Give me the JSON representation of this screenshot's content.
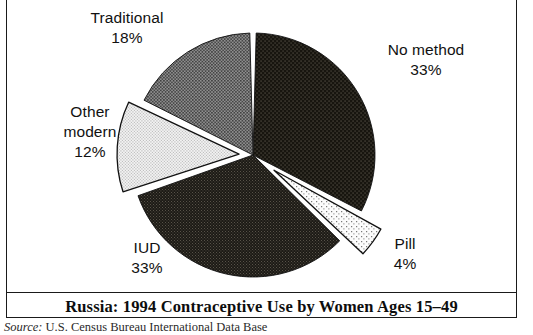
{
  "figure": {
    "title": "Russia: 1994 Contraceptive Use by Women Ages 15–49",
    "source_label": "Source:",
    "source_text": " U.S. Census Bureau International Data Base",
    "frame_color": "#1a1a1a",
    "background": "#ffffff"
  },
  "labels": {
    "no_method": {
      "name": "No method",
      "pct": "33%"
    },
    "traditional": {
      "name": "Traditional",
      "pct": "18%"
    },
    "other_modern": {
      "name_line1": "Other",
      "name_line2": "modern",
      "pct": "12%"
    },
    "iud": {
      "name": "IUD",
      "pct": "33%"
    },
    "pill": {
      "name": "Pill",
      "pct": "4%"
    }
  },
  "chart_data": {
    "type": "pie",
    "title": "Russia: 1994 Contraceptive Use by Women Ages 15–49",
    "xlabel": "",
    "ylabel": "",
    "units": "percent of women ages 15–49",
    "start_angle_deg": 0,
    "direction": "clockwise",
    "center_px": [
      253,
      155
    ],
    "radius_px": 122,
    "legend": "none (direct slice labels)",
    "grid": false,
    "categories": [
      "No method",
      "Pill",
      "IUD",
      "Other modern",
      "Traditional"
    ],
    "values": [
      33,
      4,
      33,
      12,
      18
    ],
    "slices": [
      {
        "label": "No method",
        "value": 33,
        "value_text": "33%",
        "start_deg": 0,
        "end_deg": 118.8,
        "fill": "#17150f",
        "pattern": "fine-light-dots-on-black",
        "exploded": false,
        "explode_px": 0
      },
      {
        "label": "Pill",
        "value": 4,
        "value_text": "4%",
        "start_deg": 118.8,
        "end_deg": 133.2,
        "fill": "#fbfbfb",
        "pattern": "sparse-dark-dots-on-white",
        "exploded": true,
        "explode_px": 26
      },
      {
        "label": "IUD",
        "value": 33,
        "value_text": "33%",
        "start_deg": 133.2,
        "end_deg": 252.0,
        "fill": "#1d1b16",
        "pattern": "dense-fine-dots-dark",
        "exploded": false,
        "explode_px": 0
      },
      {
        "label": "Other modern",
        "value": 12,
        "value_text": "12%",
        "start_deg": 252.0,
        "end_deg": 295.2,
        "fill": "#e8e8e8",
        "pattern": "fine-dots-light-gray",
        "exploded": true,
        "explode_px": 14
      },
      {
        "label": "Traditional",
        "value": 18,
        "value_text": "18%",
        "start_deg": 295.2,
        "end_deg": 360.0,
        "fill": "#6e6e6e",
        "pattern": "medium-gray-dots",
        "exploded": false,
        "explode_px": 0
      }
    ],
    "total": 100
  }
}
